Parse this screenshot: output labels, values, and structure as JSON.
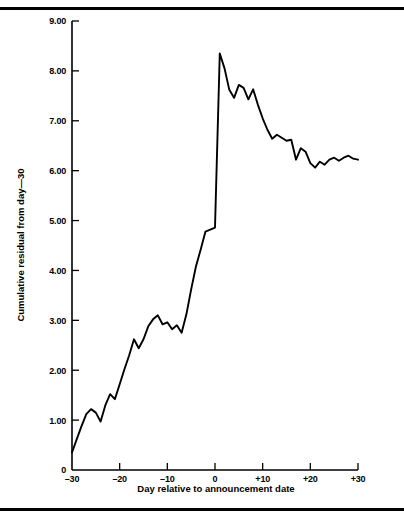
{
  "figure": {
    "top_rule": "horizontal-rule",
    "bottom_rule": "horizontal-rule"
  },
  "chart_data": {
    "type": "line",
    "title": "",
    "xlabel": "Day relative to announcement date",
    "ylabel": "Cumulative residual from day—30",
    "xlim": [
      -30,
      30
    ],
    "ylim": [
      0,
      9
    ],
    "grid": false,
    "legend": null,
    "xticks": [
      -30,
      -20,
      -10,
      0,
      10,
      20,
      30
    ],
    "xtick_labels": [
      "–30",
      "–20",
      "–10",
      "0",
      "+10",
      "+20",
      "+30"
    ],
    "yticks": [
      0,
      1,
      2,
      3,
      4,
      5,
      6,
      7,
      8,
      9
    ],
    "ytick_labels": [
      "0",
      "1.00",
      "2.00",
      "3.00",
      "4.00",
      "5.00",
      "6.00",
      "7.00",
      "8.00",
      "9.00"
    ],
    "series": [
      {
        "name": "Cumulative residual",
        "x": [
          -30,
          -29,
          -28,
          -27,
          -26,
          -25,
          -24,
          -23,
          -22,
          -21,
          -20,
          -19,
          -18,
          -17,
          -16,
          -15,
          -14,
          -13,
          -12,
          -11,
          -10,
          -9,
          -8,
          -7,
          -6,
          -5,
          -4,
          -3,
          -2,
          -1,
          0,
          1,
          2,
          3,
          4,
          5,
          6,
          7,
          8,
          9,
          10,
          11,
          12,
          13,
          14,
          15,
          16,
          17,
          18,
          19,
          20,
          21,
          22,
          23,
          24,
          25,
          26,
          27,
          28,
          29,
          30
        ],
        "values": [
          0.35,
          0.62,
          0.88,
          1.12,
          1.22,
          1.15,
          0.97,
          1.3,
          1.52,
          1.42,
          1.72,
          2.02,
          2.3,
          2.62,
          2.44,
          2.62,
          2.88,
          3.02,
          3.1,
          2.92,
          2.96,
          2.82,
          2.9,
          2.75,
          3.12,
          3.62,
          4.08,
          4.42,
          4.78,
          4.82,
          4.86,
          8.35,
          8.05,
          7.62,
          7.46,
          7.72,
          7.66,
          7.43,
          7.63,
          7.32,
          7.05,
          6.82,
          6.64,
          6.72,
          6.66,
          6.6,
          6.62,
          6.22,
          6.45,
          6.38,
          6.15,
          6.06,
          6.18,
          6.12,
          6.22,
          6.26,
          6.2,
          6.26,
          6.3,
          6.24,
          6.22
        ]
      }
    ]
  }
}
